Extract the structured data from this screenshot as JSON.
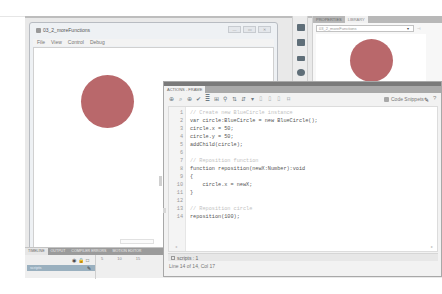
{
  "swf_window": {
    "title": "03_2_moreFunctions",
    "controls": [
      "—",
      "▭",
      "✕"
    ],
    "menu": [
      "File",
      "View",
      "Control",
      "Debug"
    ]
  },
  "library_panel": {
    "tabs": [
      {
        "label": "Properties",
        "active": false
      },
      {
        "label": "Library",
        "active": true
      }
    ],
    "document_select": "03_2_moreFunctions",
    "select_arrow": "▾",
    "pin": "⊣"
  },
  "colors": {
    "circle_fill": "#b9686b",
    "timeline_layer_highlight": "#9ab0bf",
    "panel_title_bar": "#7a7a7a"
  },
  "actions_panel": {
    "tab_label": "Actions - Frame",
    "toolbar_icons": [
      "⊕",
      "⌕",
      "⊕",
      "✔",
      "≣",
      "⊞",
      "⚲",
      "⇅",
      "⇵",
      "▾",
      "⌷",
      "⌷",
      "⌷",
      "⌑"
    ],
    "code_snippets_label": "Code Snippets",
    "wand_icon": "✎",
    "help_icon": "?",
    "code_lines": [
      {
        "n": "1",
        "text": "// Create new BlueCircle instance",
        "comment": true
      },
      {
        "n": "2",
        "text": "var circle:BlueCircle = new BlueCircle();",
        "comment": false
      },
      {
        "n": "3",
        "text": "circle.x = 50;",
        "comment": false
      },
      {
        "n": "4",
        "text": "circle.y = 50;",
        "comment": false
      },
      {
        "n": "5",
        "text": "addChild(circle);",
        "comment": false
      },
      {
        "n": "6",
        "text": "",
        "comment": false
      },
      {
        "n": "7",
        "text": "// Reposition function",
        "comment": true
      },
      {
        "n": "8",
        "text": "function reposition(newX:Number):void",
        "comment": false
      },
      {
        "n": "9",
        "text": "{",
        "comment": false
      },
      {
        "n": "10",
        "text": "    circle.x = newX;",
        "comment": false
      },
      {
        "n": "11",
        "text": "}",
        "comment": false
      },
      {
        "n": "12",
        "text": "",
        "comment": false
      },
      {
        "n": "13",
        "text": "// Reposition circle",
        "comment": true
      },
      {
        "n": "14",
        "text": "reposition(100);",
        "comment": false
      }
    ],
    "script_tab": "scripts : 1",
    "status": "Line 14 of 14, Col 17"
  },
  "timeline": {
    "tabs": [
      {
        "label": "Timeline",
        "active": true
      },
      {
        "label": "Output",
        "active": false
      },
      {
        "label": "Compiler Errors",
        "active": false
      },
      {
        "label": "Motion Editor",
        "active": false
      }
    ],
    "layer_icons": [
      "◉",
      "🔒",
      "□"
    ],
    "frame_ruler": [
      "5",
      "10",
      "15"
    ],
    "layer_name": "scripts"
  }
}
